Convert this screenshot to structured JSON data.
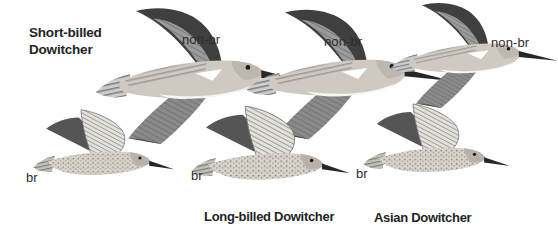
{
  "plate": {
    "background": "#ffffff",
    "text_color": "#242424"
  },
  "title": {
    "line1": "Short-billed",
    "line2": "Dowitcher"
  },
  "annotations": {
    "shortbilled_nonbr": "non-br",
    "longbilled_nonbr": "non-br",
    "asian_nonbr": "non-br",
    "shortbilled_br": "br",
    "longbilled_br": "br",
    "asian_br": "br"
  },
  "captions": {
    "long_billed": "Long-billed Dowitcher",
    "asian": "Asian Dowitcher"
  },
  "birds": [
    {
      "species": "Short-billed Dowitcher",
      "plumage_label": "non-br",
      "pose": "flying right, far wing raised, near wing down"
    },
    {
      "species": "Long-billed Dowitcher",
      "plumage_label": "non-br",
      "pose": "flying right, far wing raised, near wing down"
    },
    {
      "species": "Asian Dowitcher",
      "plumage_label": "non-br",
      "pose": "flying right, far wing raised, near wing down"
    },
    {
      "species": "Short-billed Dowitcher",
      "plumage_label": "br",
      "pose": "flying right, both wings raised"
    },
    {
      "species": "Long-billed Dowitcher",
      "plumage_label": "br",
      "pose": "flying right, both wings raised"
    },
    {
      "species": "Asian Dowitcher",
      "plumage_label": "br",
      "pose": "flying right, both wings raised"
    }
  ],
  "colors": {
    "wing_dark": "#3f3f3f",
    "wing_mid": "#8a8a8a",
    "body_light": "#cfc9c2",
    "belly_white": "#f7f6f4",
    "ink": "#262626"
  }
}
